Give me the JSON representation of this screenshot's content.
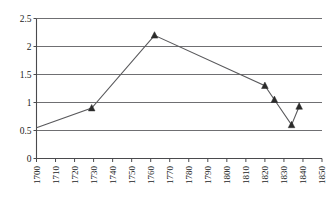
{
  "chart_data": {
    "type": "line",
    "title": "",
    "subtitle": "",
    "xlabel": "",
    "ylabel": "",
    "xlim": [
      1700,
      1850
    ],
    "ylim": [
      0,
      2.5
    ],
    "ytick_step": 0.5,
    "xtick_step": 10,
    "grid": "horizontal",
    "legend": "none",
    "marker": "triangle-filled",
    "series": [
      {
        "name": "series-1",
        "x": [
          1700,
          1729,
          1762,
          1820,
          1825,
          1834,
          1838
        ],
        "values": [
          0.55,
          0.9,
          2.2,
          1.3,
          1.05,
          0.6,
          0.93
        ],
        "marker_shown": [
          false,
          true,
          true,
          true,
          true,
          true,
          true
        ]
      }
    ],
    "yticks": [
      "0",
      "0.5",
      "1",
      "1.5",
      "2",
      "2.5"
    ],
    "ytick_values": [
      0,
      0.5,
      1,
      1.5,
      2,
      2.5
    ],
    "xticks": [
      "1700",
      "1710",
      "1720",
      "1730",
      "1740",
      "1750",
      "1760",
      "1770",
      "1780",
      "1790",
      "1800",
      "1810",
      "1820",
      "1830",
      "1840",
      "1850"
    ],
    "xtick_values": [
      1700,
      1710,
      1720,
      1730,
      1740,
      1750,
      1760,
      1770,
      1780,
      1790,
      1800,
      1810,
      1820,
      1830,
      1840,
      1850
    ],
    "colors": {
      "line": "#59595c",
      "marker": "#2b2b2b",
      "grid": "#6f6f72",
      "axis": "#4a4a4d",
      "background": "#ffffff",
      "text": "#1a1a1a"
    }
  }
}
